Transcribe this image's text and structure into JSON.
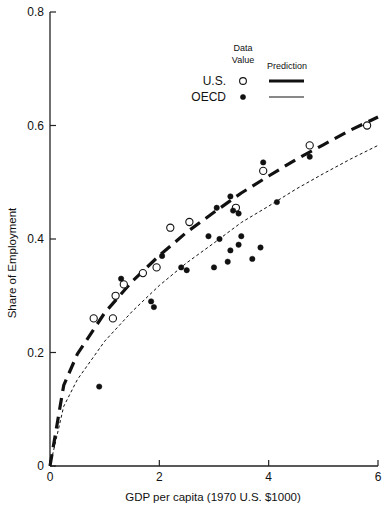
{
  "chart_data": {
    "type": "scatter",
    "title": "",
    "xlabel": "GDP per capita (1970 U.S. $1000)",
    "ylabel": "Share of Employment",
    "xlim": [
      0,
      6
    ],
    "ylim": [
      0,
      0.8
    ],
    "xticks": [
      0,
      2,
      4,
      6
    ],
    "xtick_labels": [
      "0",
      "2",
      "4",
      "6"
    ],
    "yticks": [
      0,
      0.2,
      0.4,
      0.6,
      0.8
    ],
    "ytick_labels": [
      "0",
      "0.2",
      "0.4",
      "0.6",
      "0.8"
    ],
    "grid": false,
    "legend": {
      "position": "upper-center-right",
      "column_headers": [
        "Data Value",
        "Prediction"
      ],
      "entries": [
        {
          "label": "U.S.",
          "marker": "open-circle",
          "line": "thick-dashed"
        },
        {
          "label": "OECD",
          "marker": "filled-circle",
          "line": "thin-dashed"
        }
      ]
    },
    "series": [
      {
        "name": "U.S.",
        "kind": "data",
        "marker": "open-circle",
        "points": [
          [
            0.8,
            0.26
          ],
          [
            1.15,
            0.26
          ],
          [
            1.2,
            0.3
          ],
          [
            1.35,
            0.32
          ],
          [
            1.7,
            0.34
          ],
          [
            1.95,
            0.35
          ],
          [
            2.2,
            0.42
          ],
          [
            2.55,
            0.43
          ],
          [
            3.4,
            0.455
          ],
          [
            3.9,
            0.52
          ],
          [
            4.75,
            0.565
          ],
          [
            5.8,
            0.6
          ]
        ]
      },
      {
        "name": "OECD",
        "kind": "data",
        "marker": "filled-circle",
        "points": [
          [
            0.9,
            0.14
          ],
          [
            1.3,
            0.33
          ],
          [
            1.85,
            0.29
          ],
          [
            1.9,
            0.28
          ],
          [
            2.05,
            0.37
          ],
          [
            2.4,
            0.35
          ],
          [
            2.5,
            0.345
          ],
          [
            2.9,
            0.405
          ],
          [
            3.0,
            0.35
          ],
          [
            3.05,
            0.455
          ],
          [
            3.1,
            0.4
          ],
          [
            3.25,
            0.36
          ],
          [
            3.3,
            0.38
          ],
          [
            3.3,
            0.475
          ],
          [
            3.35,
            0.45
          ],
          [
            3.45,
            0.39
          ],
          [
            3.45,
            0.445
          ],
          [
            3.5,
            0.405
          ],
          [
            3.7,
            0.365
          ],
          [
            3.85,
            0.385
          ],
          [
            3.9,
            0.535
          ],
          [
            4.15,
            0.465
          ],
          [
            4.75,
            0.545
          ]
        ]
      },
      {
        "name": "U.S. Prediction",
        "kind": "line",
        "style": "thick-dashed",
        "x": [
          0,
          0.25,
          0.5,
          1,
          1.5,
          2,
          2.5,
          3,
          3.5,
          4,
          4.5,
          5,
          5.5,
          6
        ],
        "values": [
          0,
          0.142,
          0.197,
          0.27,
          0.325,
          0.371,
          0.412,
          0.447,
          0.481,
          0.511,
          0.54,
          0.566,
          0.592,
          0.615
        ]
      },
      {
        "name": "OECD Prediction",
        "kind": "line",
        "style": "thin-dashed",
        "x": [
          0,
          0.25,
          0.5,
          1,
          1.5,
          2,
          2.5,
          3,
          3.5,
          4,
          4.5,
          5,
          5.5,
          6
        ],
        "values": [
          0,
          0.105,
          0.152,
          0.22,
          0.272,
          0.318,
          0.358,
          0.393,
          0.429,
          0.458,
          0.488,
          0.515,
          0.541,
          0.565
        ]
      }
    ]
  }
}
